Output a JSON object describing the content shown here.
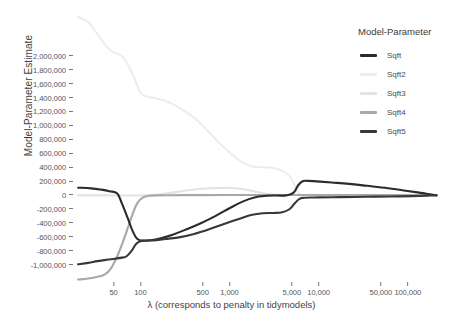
{
  "chart_data": {
    "type": "line",
    "title": "",
    "xlabel": "λ (corresponds to penalty in tidymodels)",
    "ylabel": "Model-Parameter Estimate",
    "xscale": "log",
    "xlim": [
      18,
      230000
    ],
    "ylim": [
      -1250000,
      2600000
    ],
    "grid": false,
    "legend": {
      "title": "Model-Parameter",
      "position": "right",
      "entries": [
        "Sqft",
        "Sqft2",
        "Sqft3",
        "Sqft4",
        "Sqft5"
      ]
    },
    "x_ticks": [
      50,
      100,
      500,
      1000,
      5000,
      10000,
      50000,
      100000
    ],
    "x_tick_labels": [
      "50",
      "100",
      "500",
      "1,000",
      "5,000",
      "10,000",
      "50,000",
      "100,000"
    ],
    "y_ticks": [
      2000000,
      1800000,
      1600000,
      1400000,
      1200000,
      1000000,
      800000,
      600000,
      400000,
      200000,
      0,
      -200000,
      -400000,
      -600000,
      -800000,
      -1000000
    ],
    "y_tick_labels": [
      "2,000,000",
      "1,800,000",
      "1,600,000",
      "1,400,000",
      "1,200,000",
      "1,000,000",
      "800,000",
      "600,000",
      "400,000",
      "200,000",
      "0",
      "-200,000",
      "-400,000",
      "-600,000",
      "-800,000",
      "-1,000,000"
    ],
    "colors": {
      "Sqft": "#2b2b2b",
      "Sqft2": "#ededed",
      "Sqft3": "#e2e2e2",
      "Sqft4": "#a8a8a8",
      "Sqft5": "#383838"
    },
    "series": [
      {
        "name": "Sqft",
        "color": "#2b2b2b",
        "points": [
          [
            20,
            105000
          ],
          [
            28,
            95000
          ],
          [
            36,
            78000
          ],
          [
            45,
            55000
          ],
          [
            55,
            20000
          ],
          [
            62,
            -120000
          ],
          [
            72,
            -330000
          ],
          [
            82,
            -520000
          ],
          [
            92,
            -630000
          ],
          [
            105,
            -655000
          ],
          [
            130,
            -650000
          ],
          [
            170,
            -620000
          ],
          [
            230,
            -570000
          ],
          [
            320,
            -500000
          ],
          [
            470,
            -410000
          ],
          [
            700,
            -300000
          ],
          [
            1000,
            -190000
          ],
          [
            1400,
            -95000
          ],
          [
            1900,
            -35000
          ],
          [
            2600,
            -12000
          ],
          [
            3400,
            -8000
          ],
          [
            4300,
            -6000
          ],
          [
            5200,
            30000
          ],
          [
            5900,
            140000
          ],
          [
            6600,
            198000
          ],
          [
            7600,
            203000
          ],
          [
            9500,
            196000
          ],
          [
            14000,
            180000
          ],
          [
            22000,
            160000
          ],
          [
            35000,
            132000
          ],
          [
            60000,
            98000
          ],
          [
            95000,
            62000
          ],
          [
            140000,
            30000
          ],
          [
            185000,
            8000
          ],
          [
            210000,
            -5000
          ]
        ]
      },
      {
        "name": "Sqft2",
        "color": "#ededed",
        "points": [
          [
            20,
            2560000
          ],
          [
            26,
            2480000
          ],
          [
            33,
            2310000
          ],
          [
            42,
            2130000
          ],
          [
            50,
            2050000
          ],
          [
            58,
            2020000
          ],
          [
            66,
            1960000
          ],
          [
            76,
            1820000
          ],
          [
            88,
            1640000
          ],
          [
            100,
            1470000
          ],
          [
            118,
            1415000
          ],
          [
            150,
            1390000
          ],
          [
            210,
            1330000
          ],
          [
            300,
            1220000
          ],
          [
            420,
            1090000
          ],
          [
            560,
            930000
          ],
          [
            750,
            760000
          ],
          [
            1000,
            610000
          ],
          [
            1350,
            480000
          ],
          [
            1800,
            410000
          ],
          [
            2400,
            398000
          ],
          [
            3200,
            385000
          ],
          [
            4200,
            330000
          ],
          [
            5000,
            230000
          ],
          [
            5600,
            80000
          ],
          [
            6200,
            8000
          ],
          [
            7200,
            2000
          ],
          [
            9000,
            0
          ],
          [
            14000,
            0
          ],
          [
            30000,
            0
          ],
          [
            80000,
            0
          ],
          [
            210000,
            0
          ]
        ]
      },
      {
        "name": "Sqft3",
        "color": "#e2e2e2",
        "points": [
          [
            20,
            -5000
          ],
          [
            40,
            -6000
          ],
          [
            70,
            -8000
          ],
          [
            110,
            -6000
          ],
          [
            170,
            10000
          ],
          [
            260,
            45000
          ],
          [
            400,
            78000
          ],
          [
            620,
            97000
          ],
          [
            900,
            103000
          ],
          [
            1200,
            96000
          ],
          [
            1600,
            72000
          ],
          [
            2100,
            40000
          ],
          [
            2700,
            14000
          ],
          [
            3500,
            3000
          ],
          [
            4600,
            0
          ],
          [
            6200,
            0
          ],
          [
            10000,
            0
          ],
          [
            25000,
            0
          ],
          [
            80000,
            0
          ],
          [
            210000,
            0
          ]
        ]
      },
      {
        "name": "Sqft4",
        "color": "#a8a8a8",
        "points": [
          [
            20,
            -1215000
          ],
          [
            26,
            -1200000
          ],
          [
            33,
            -1175000
          ],
          [
            40,
            -1140000
          ],
          [
            47,
            -1050000
          ],
          [
            55,
            -880000
          ],
          [
            63,
            -690000
          ],
          [
            72,
            -480000
          ],
          [
            82,
            -270000
          ],
          [
            92,
            -120000
          ],
          [
            105,
            -40000
          ],
          [
            125,
            -12000
          ],
          [
            160,
            -5000
          ],
          [
            230,
            -3000
          ],
          [
            400,
            -2000
          ],
          [
            900,
            -1000
          ],
          [
            2500,
            0
          ],
          [
            8000,
            0
          ],
          [
            30000,
            0
          ],
          [
            100000,
            0
          ],
          [
            210000,
            0
          ]
        ]
      },
      {
        "name": "Sqft5",
        "color": "#383838",
        "points": [
          [
            20,
            -995000
          ],
          [
            26,
            -975000
          ],
          [
            33,
            -950000
          ],
          [
            42,
            -930000
          ],
          [
            52,
            -915000
          ],
          [
            62,
            -900000
          ],
          [
            70,
            -880000
          ],
          [
            80,
            -800000
          ],
          [
            90,
            -700000
          ],
          [
            102,
            -660000
          ],
          [
            120,
            -655000
          ],
          [
            150,
            -648000
          ],
          [
            200,
            -630000
          ],
          [
            280,
            -605000
          ],
          [
            400,
            -560000
          ],
          [
            600,
            -490000
          ],
          [
            900,
            -410000
          ],
          [
            1300,
            -340000
          ],
          [
            1800,
            -285000
          ],
          [
            2400,
            -262000
          ],
          [
            3100,
            -258000
          ],
          [
            3900,
            -248000
          ],
          [
            4700,
            -205000
          ],
          [
            5400,
            -120000
          ],
          [
            6100,
            -55000
          ],
          [
            7000,
            -40000
          ],
          [
            9000,
            -36000
          ],
          [
            14000,
            -32000
          ],
          [
            25000,
            -28000
          ],
          [
            45000,
            -24000
          ],
          [
            80000,
            -20000
          ],
          [
            130000,
            -14000
          ],
          [
            180000,
            -8000
          ],
          [
            210000,
            -5000
          ]
        ]
      }
    ]
  }
}
